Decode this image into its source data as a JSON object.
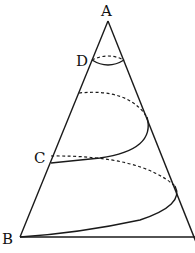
{
  "diagram": {
    "type": "cone-helix",
    "labels": {
      "A": "A",
      "B": "B",
      "C": "C",
      "D": "D"
    },
    "points": {
      "A": [
        108,
        21
      ],
      "B": [
        20,
        237
      ],
      "C": [
        50,
        163
      ],
      "D": [
        92,
        60
      ]
    }
  }
}
